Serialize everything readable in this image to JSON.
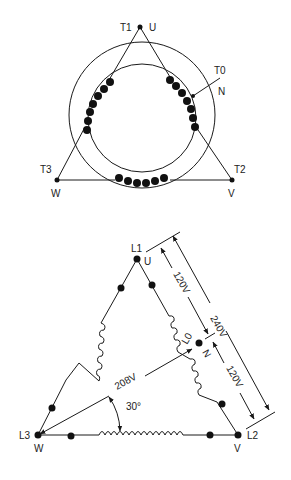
{
  "top_diagram": {
    "title": "Generator winding arrangement (delta, center-tapped)",
    "terminals": {
      "t1": "T1",
      "u": "U",
      "t0": "T0",
      "n": "N",
      "t3": "T3",
      "w": "W",
      "t2": "T2",
      "v": "V"
    }
  },
  "bottom_diagram": {
    "terminals": {
      "l1": "L1",
      "u": "U",
      "l0": "L0",
      "n": "N",
      "l3": "L3",
      "w": "W",
      "l2": "L2",
      "v": "V"
    },
    "measurements": {
      "v_120_upper": "120V",
      "v_240": "240V",
      "v_120_lower": "120V",
      "v_208": "208V",
      "angle": "30°"
    }
  },
  "colors": {
    "line": "#1a1a1a",
    "background": "#ffffff"
  }
}
